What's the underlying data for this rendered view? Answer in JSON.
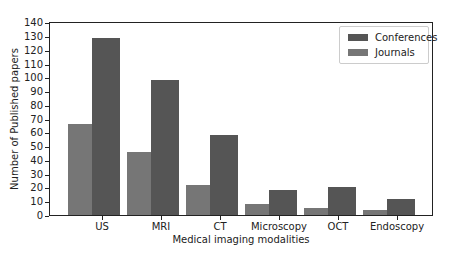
{
  "chart_data": {
    "type": "bar",
    "title": "",
    "xlabel": "Medical imaging modalities",
    "ylabel": "Number of Published papers",
    "categories": [
      "US",
      "MRI",
      "CT",
      "Microscopy",
      "OCT",
      "Endoscopy"
    ],
    "series": [
      {
        "name": "Journals",
        "color": "#767676",
        "values": [
          66,
          46,
          22,
          8,
          5,
          4
        ]
      },
      {
        "name": "Conferences",
        "color": "#555555",
        "values": [
          129,
          98,
          58,
          18,
          20,
          12
        ]
      }
    ],
    "ylim": [
      0,
      141
    ],
    "yticks": [
      0,
      10,
      20,
      30,
      40,
      50,
      60,
      70,
      80,
      90,
      100,
      110,
      120,
      130,
      140
    ],
    "grid": false,
    "legend": {
      "position": "upper right",
      "entries": [
        "Conferences",
        "Journals"
      ]
    }
  }
}
